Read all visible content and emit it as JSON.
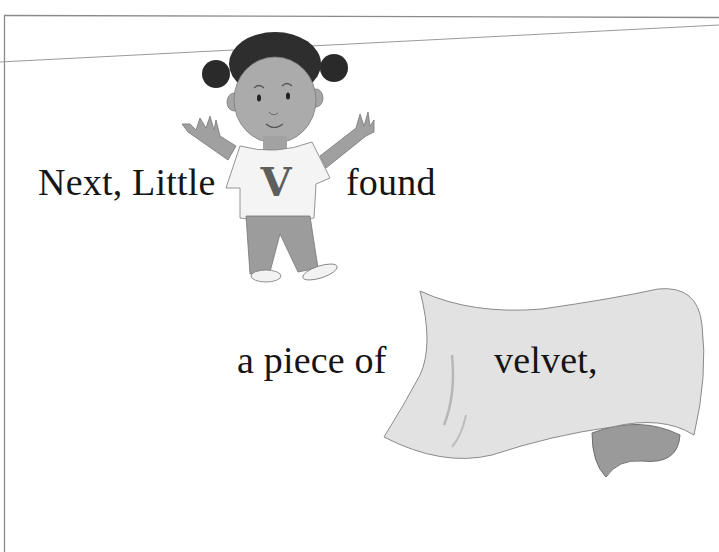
{
  "page": {
    "type": "childrens-book-page",
    "text_segments": [
      "Next, Little",
      "found",
      "a piece of",
      "velvet,"
    ],
    "illustrations": [
      {
        "name": "girl-character",
        "shirt_letter": "V"
      },
      {
        "name": "velvet-fabric"
      }
    ],
    "colors": {
      "background": "#ffffff",
      "text": "#151515",
      "frame_line": "#8a8a8a",
      "fabric_light": "#e2e2e2",
      "fabric_shadow": "#9a9a9a",
      "skin": "#a9a9a9",
      "hair": "#2a2a2a",
      "shirt": "#f4f4f4",
      "shirt_letter": "#5e5e5e",
      "pants": "#9c9c9c"
    }
  }
}
